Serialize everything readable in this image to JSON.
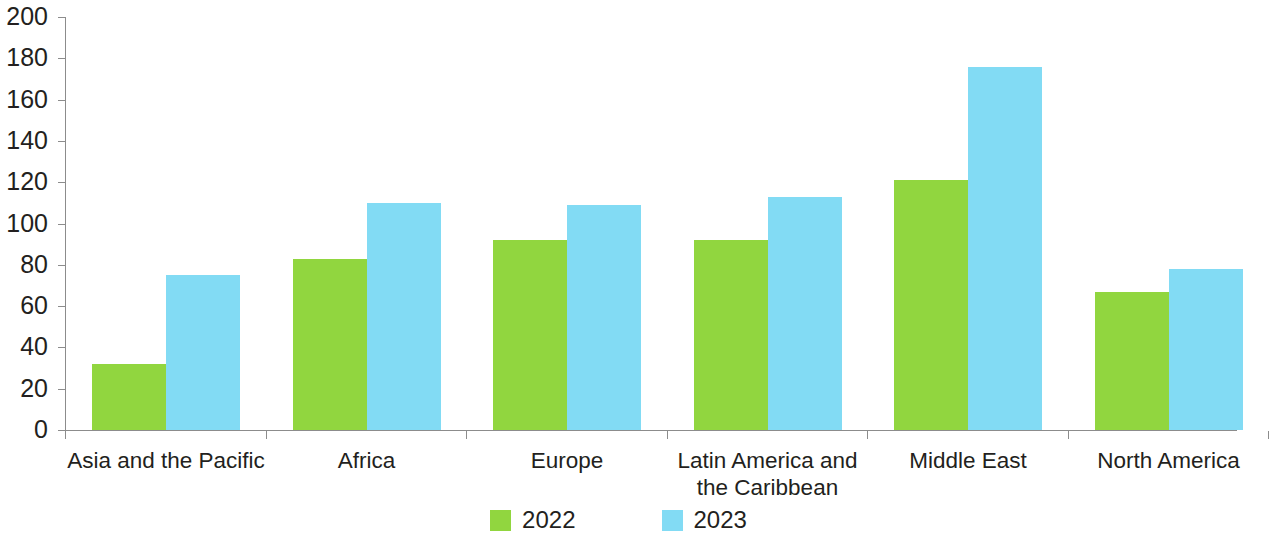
{
  "chart_data": {
    "type": "bar",
    "title": "",
    "subtitle": "",
    "xlabel": "",
    "ylabel": "",
    "ylim": [
      0,
      200
    ],
    "ytick_step": 20,
    "yticks": [
      0,
      20,
      40,
      60,
      80,
      100,
      120,
      140,
      160,
      180,
      200
    ],
    "ytick_labels": [
      "0",
      "20",
      "40",
      "60",
      "80",
      "100",
      "120",
      "140",
      "160",
      "180",
      "200"
    ],
    "grid": false,
    "legend_position": "bottom-center",
    "categories": [
      "Asia and the Pacific",
      "Africa",
      "Europe",
      "Latin America and\nthe Caribbean",
      "Middle East",
      "North America"
    ],
    "series": [
      {
        "name": "2022",
        "color": "#91d63f",
        "values": [
          32,
          83,
          92,
          92,
          121,
          67
        ]
      },
      {
        "name": "2023",
        "color": "#82dbf4",
        "values": [
          75,
          110,
          109,
          113,
          176,
          78
        ]
      }
    ]
  },
  "legend": {
    "items": [
      {
        "label": "2022",
        "color": "#91d63f"
      },
      {
        "label": "2023",
        "color": "#82dbf4"
      }
    ]
  },
  "axis": {
    "line_color": "#8c8c8c",
    "tick_color": "#8c8c8c"
  }
}
